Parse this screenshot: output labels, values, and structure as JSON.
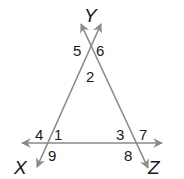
{
  "diagram": {
    "type": "geometry-triangle-with-extended-sides",
    "vertices": [
      {
        "name": "Y",
        "label": "Y",
        "x": 93,
        "y": 26
      },
      {
        "name": "X",
        "label": "X",
        "x": 15,
        "y": 172
      },
      {
        "name": "Z",
        "label": "Z",
        "x": 150,
        "y": 172
      }
    ],
    "angles": [
      {
        "id": "1",
        "label": "1",
        "x": 55,
        "y": 139
      },
      {
        "id": "2",
        "label": "2",
        "x": 87,
        "y": 82
      },
      {
        "id": "3",
        "label": "3",
        "x": 119,
        "y": 139
      },
      {
        "id": "4",
        "label": "4",
        "x": 33,
        "y": 139
      },
      {
        "id": "5",
        "label": "5",
        "x": 74,
        "y": 56
      },
      {
        "id": "6",
        "label": "6",
        "x": 97,
        "y": 56
      },
      {
        "id": "7",
        "label": "7",
        "x": 141,
        "y": 139
      },
      {
        "id": "8",
        "label": "8",
        "x": 125,
        "y": 161
      },
      {
        "id": "9",
        "label": "9",
        "x": 49,
        "y": 161
      }
    ],
    "line_color": "#8a8a8a",
    "text_color": "#1a1a1a"
  }
}
